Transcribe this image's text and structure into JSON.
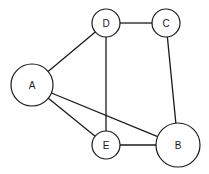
{
  "diagram": {
    "type": "undirected-graph",
    "colors": {
      "stroke": "#1a1a1a",
      "node_fill": "#ffffff",
      "background": "#ffffff"
    },
    "nodes": [
      {
        "id": "A",
        "label": "A",
        "cx": 32,
        "cy": 85,
        "r": 21
      },
      {
        "id": "D",
        "label": "D",
        "cx": 106,
        "cy": 23,
        "r": 14
      },
      {
        "id": "C",
        "label": "C",
        "cx": 166,
        "cy": 23,
        "r": 14
      },
      {
        "id": "E",
        "label": "E",
        "cx": 106,
        "cy": 145,
        "r": 14
      },
      {
        "id": "B",
        "label": "B",
        "cx": 178,
        "cy": 145,
        "r": 22
      }
    ],
    "edges": [
      {
        "from": "A",
        "to": "D"
      },
      {
        "from": "A",
        "to": "E"
      },
      {
        "from": "A",
        "to": "B"
      },
      {
        "from": "D",
        "to": "C"
      },
      {
        "from": "D",
        "to": "E"
      },
      {
        "from": "C",
        "to": "B"
      },
      {
        "from": "E",
        "to": "B"
      }
    ]
  }
}
